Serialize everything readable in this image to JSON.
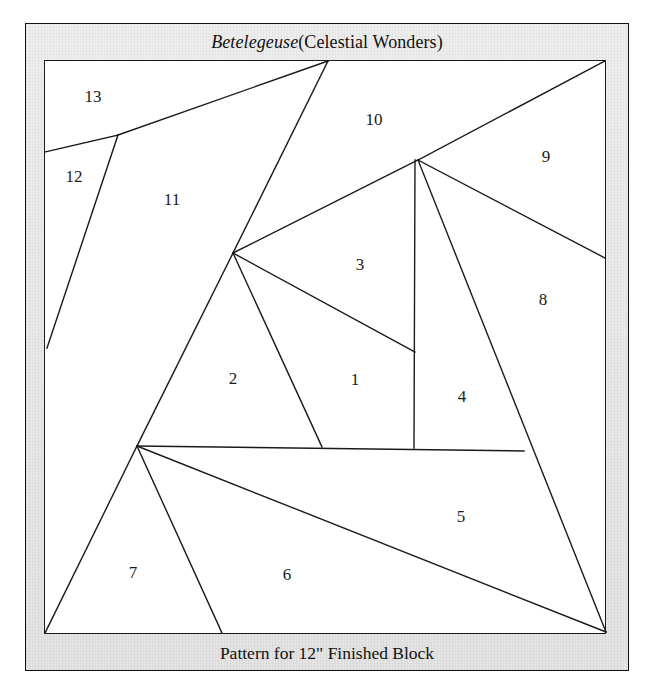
{
  "document": {
    "title_italic": "Betelegeuse",
    "title_rest": " (Celestial Wonders)",
    "title_full": "Betelegeuse (Celestial Wonders)",
    "caption": "Pattern for 12\" Finished Block",
    "kind": "paper-piecing quilt block pattern diagram"
  },
  "colors": {
    "page_background": "#ffffff",
    "mat_background": "#ececec",
    "block_background": "#ffffff",
    "line_color": "#1a1a1a",
    "text_color": "#111111"
  },
  "block": {
    "outline": {
      "x": 44,
      "y": 60,
      "width": 562,
      "height": 574
    },
    "pieces": [
      {
        "label": "1",
        "x": 355,
        "y": 380
      },
      {
        "label": "2",
        "x": 233,
        "y": 379
      },
      {
        "label": "3",
        "x": 360,
        "y": 265
      },
      {
        "label": "4",
        "x": 462,
        "y": 397
      },
      {
        "label": "5",
        "x": 461,
        "y": 517
      },
      {
        "label": "6",
        "x": 287,
        "y": 575
      },
      {
        "label": "7",
        "x": 133,
        "y": 573
      },
      {
        "label": "8",
        "x": 543,
        "y": 300
      },
      {
        "label": "9",
        "x": 546,
        "y": 157
      },
      {
        "label": "10",
        "x": 374,
        "y": 120
      },
      {
        "label": "11",
        "x": 172,
        "y": 200
      },
      {
        "label": "12",
        "x": 74,
        "y": 177
      },
      {
        "label": "13",
        "x": 93,
        "y": 97
      }
    ],
    "seam_lines": [
      {
        "name": "top-vertex-to-upper-left-notch",
        "x1": 328,
        "y1": 61,
        "x2": 118,
        "y2": 135
      },
      {
        "name": "upper-left-notch-to-left-edge",
        "x1": 118,
        "y1": 135,
        "x2": 45,
        "y2": 152
      },
      {
        "name": "piece12-right-edge",
        "x1": 118,
        "y1": 135,
        "x2": 47,
        "y2": 348
      },
      {
        "name": "top-vertex-to-center-hub",
        "x1": 328,
        "y1": 61,
        "x2": 233,
        "y2": 253
      },
      {
        "name": "center-hub-to-right-hub",
        "x1": 233,
        "y1": 253,
        "x2": 418,
        "y2": 160
      },
      {
        "name": "center-hub-to-piece1-notch",
        "x1": 233,
        "y1": 253,
        "x2": 415,
        "y2": 352
      },
      {
        "name": "center-hub-to-horizontal",
        "x1": 233,
        "y1": 253,
        "x2": 322,
        "y2": 447
      },
      {
        "name": "center-hub-to-lower-hub",
        "x1": 233,
        "y1": 253,
        "x2": 137,
        "y2": 446
      },
      {
        "name": "right-hub-to-top-right-corner",
        "x1": 418,
        "y1": 160,
        "x2": 605,
        "y2": 61
      },
      {
        "name": "right-hub-to-right-edge",
        "x1": 418,
        "y1": 160,
        "x2": 605,
        "y2": 258
      },
      {
        "name": "right-hub-vertical",
        "x1": 415,
        "y1": 160,
        "x2": 414,
        "y2": 448
      },
      {
        "name": "right-hub-to-bottom-right",
        "x1": 418,
        "y1": 160,
        "x2": 606,
        "y2": 632
      },
      {
        "name": "mid-horizontal",
        "x1": 137,
        "y1": 446,
        "x2": 524,
        "y2": 451
      },
      {
        "name": "lower-hub-to-bottom-right",
        "x1": 137,
        "y1": 446,
        "x2": 606,
        "y2": 632
      },
      {
        "name": "lower-hub-to-bottom-edge",
        "x1": 137,
        "y1": 446,
        "x2": 222,
        "y2": 633
      },
      {
        "name": "lower-hub-to-bottom-left-corner",
        "x1": 137,
        "y1": 446,
        "x2": 45,
        "y2": 633
      }
    ]
  }
}
